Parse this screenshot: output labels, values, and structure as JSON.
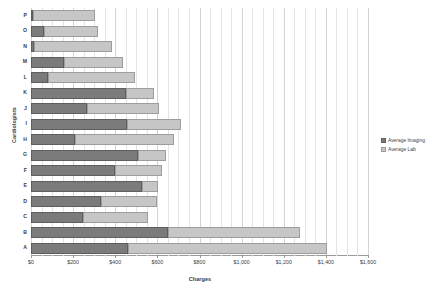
{
  "chart_data": {
    "type": "bar",
    "orientation": "horizontal",
    "stacked": true,
    "title": "",
    "xlabel": "Charges",
    "ylabel": "Cardiologists",
    "xlim": [
      0,
      1600
    ],
    "xticks": [
      0,
      200,
      400,
      600,
      800,
      1000,
      1200,
      1400,
      1600
    ],
    "xtick_labels": [
      "$0",
      "$200",
      "$400",
      "$600",
      "$800",
      "$1,000",
      "$1,200",
      "$1,400",
      "$1,600"
    ],
    "grid": true,
    "legend_position": "right",
    "categories": [
      "P",
      "O",
      "N",
      "M",
      "L",
      "K",
      "J",
      "I",
      "H",
      "G",
      "F",
      "E",
      "D",
      "C",
      "B",
      "A"
    ],
    "series": [
      {
        "name": "Average Imaging",
        "color": "#7b7b7b",
        "values": [
          10,
          62,
          15,
          155,
          80,
          450,
          265,
          455,
          210,
          510,
          400,
          525,
          330,
          245,
          650,
          460
        ]
      },
      {
        "name": "Average Lab",
        "color": "#c6c6c6",
        "values": [
          295,
          256,
          370,
          280,
          415,
          135,
          345,
          255,
          470,
          130,
          220,
          80,
          270,
          310,
          625,
          945
        ]
      }
    ],
    "totals": [
      305,
      318,
      385,
      435,
      495,
      585,
      610,
      710,
      680,
      640,
      620,
      605,
      600,
      555,
      1275,
      1405
    ]
  },
  "legend": {
    "items": [
      {
        "label": "Average Imaging",
        "swatch": "imaging"
      },
      {
        "label": "Average Lab",
        "swatch": "lab"
      }
    ]
  }
}
